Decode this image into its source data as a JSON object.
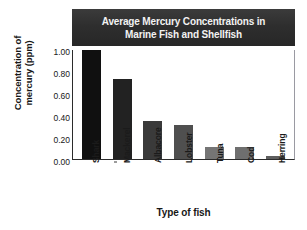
{
  "chart_data": {
    "type": "bar",
    "title": "Average Mercury Concentrations in Marine Fish and Shellfish",
    "title_lines": [
      "Average Mercury Concentrations in",
      "Marine Fish and Shellfish"
    ],
    "xlabel": "Type of fish",
    "ylabel": "Concentration of mercury (ppm)",
    "ylabel_lines": [
      "Concentration of",
      "mercury (ppm)"
    ],
    "categories": [
      "Shark",
      "Mackerel",
      "Albacore",
      "Lobster",
      "Tuna",
      "Cod",
      "Herring"
    ],
    "values": [
      0.99,
      0.73,
      0.35,
      0.31,
      0.11,
      0.11,
      0.03
    ],
    "ylim": [
      0.0,
      1.0
    ],
    "ytick_values": [
      0.0,
      0.2,
      0.4,
      0.6,
      0.8,
      1.0
    ],
    "ytick_labels": [
      "0.00",
      "0.20",
      "0.40",
      "0.60",
      "0.80",
      "1.00"
    ],
    "grid": false,
    "legend": null,
    "bar_colors": [
      "#101010",
      "#222222",
      "#3a3a3a",
      "#4f4f4f",
      "#757575",
      "#6f6f6f",
      "#5e5e5e"
    ],
    "title_background": "#2e2e2e",
    "title_text_color": "#f2f2f2",
    "axis_color": "#2b2b2b",
    "plot_background": "#ffffff"
  }
}
